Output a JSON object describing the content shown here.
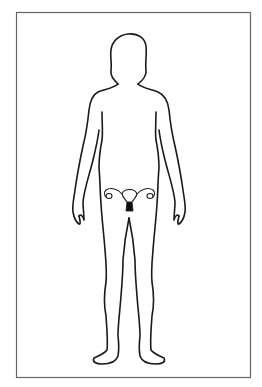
{
  "figure": {
    "highlight": "uterus-reproductive-organ",
    "colors": {
      "background": "#ffffff",
      "frame": "#666666",
      "outline": "#1a1a1a",
      "highlight_fill": "#111111"
    }
  }
}
